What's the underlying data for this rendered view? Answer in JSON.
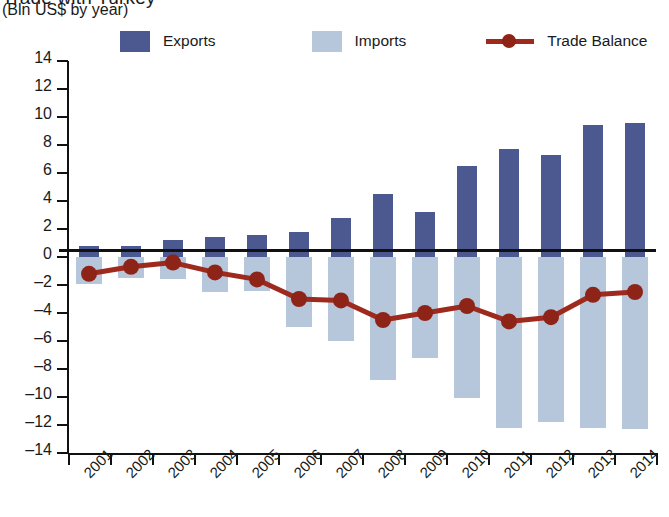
{
  "title": {
    "clipped_line": "Trade with Turkey",
    "units": "(Bln US$ by year)"
  },
  "legend": {
    "exports_label": "Exports",
    "imports_label": "Imports",
    "balance_label": "Trade Balance",
    "exports_color": "#4c5890",
    "imports_color": "#b6c7dc",
    "balance_color": "#9e2a1e"
  },
  "chart_data": {
    "type": "bar",
    "title": "Trade with Turkey",
    "subtitle": "(Bln US$ by year)",
    "xlabel": "",
    "ylabel": "Bln US$",
    "ylim": [
      -14,
      14
    ],
    "ytick_step": 2,
    "grid": false,
    "legend_position": "top",
    "categories": [
      "2001",
      "2002",
      "2003",
      "2004",
      "2005",
      "2006",
      "2007",
      "2008",
      "2009",
      "2010",
      "2011",
      "2012",
      "2013",
      "2014"
    ],
    "yticks": [
      "14",
      "12",
      "10",
      "8",
      "6",
      "4",
      "2",
      "0",
      "-2",
      "-4",
      "-6",
      "-8",
      "-10",
      "-12",
      "-14"
    ],
    "series": [
      {
        "name": "Exports",
        "type": "bar",
        "color": "#4c5890",
        "values": [
          0.8,
          0.8,
          1.2,
          1.4,
          1.6,
          1.8,
          2.8,
          4.5,
          3.2,
          6.5,
          7.7,
          7.3,
          9.4,
          9.6
        ]
      },
      {
        "name": "Imports",
        "type": "bar",
        "color": "#b6c7dc",
        "values": [
          -1.9,
          -1.5,
          -1.6,
          -2.5,
          -2.4,
          -5.0,
          -6.0,
          -8.8,
          -7.2,
          -10.1,
          -12.2,
          -11.8,
          -12.2,
          -12.3
        ]
      },
      {
        "name": "Trade Balance",
        "type": "line",
        "color": "#9e2a1e",
        "values": [
          -1.2,
          -0.7,
          -0.4,
          -1.1,
          -1.6,
          -3.0,
          -3.1,
          -4.5,
          -4.0,
          -3.5,
          -4.6,
          -4.3,
          -2.7,
          -2.5
        ]
      }
    ]
  }
}
